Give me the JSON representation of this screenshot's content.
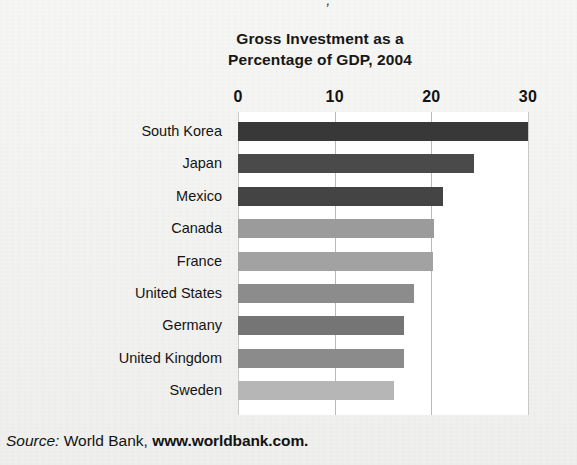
{
  "figure": {
    "top_fragment": "“  “  ,  “",
    "title_line_1": "Gross Investment as a",
    "title_line_2": "Percentage of GDP, 2004",
    "source": {
      "label": "Source:",
      "publisher": "World Bank,",
      "url": "www.worldbank.com."
    }
  },
  "chart_data": {
    "type": "bar",
    "orientation": "horizontal",
    "title": "Gross Investment as a Percentage of GDP, 2004",
    "xlabel": "",
    "ylabel": "",
    "xlim": [
      0,
      30
    ],
    "xticks": [
      0,
      10,
      20,
      30
    ],
    "xtick_labels": [
      "0",
      "10",
      "20",
      "30"
    ],
    "grid": true,
    "grid_axis": "x",
    "legend": false,
    "categories": [
      "South Korea",
      "Japan",
      "Mexico",
      "Canada",
      "France",
      "United States",
      "Germany",
      "United Kingdom",
      "Sweden"
    ],
    "values": [
      30.0,
      24.4,
      21.2,
      20.3,
      20.2,
      18.2,
      17.2,
      17.2,
      16.1
    ],
    "bar_colors": [
      "#383838",
      "#4a4a4a",
      "#444444",
      "#9b9b9b",
      "#a2a2a2",
      "#8c8c8c",
      "#757575",
      "#8b8b8b",
      "#b6b6b6"
    ]
  },
  "colors": {
    "background": "#f4f4f2",
    "plot_background": "#ffffff",
    "gridline": "#b9b9b9",
    "text": "#131313"
  }
}
